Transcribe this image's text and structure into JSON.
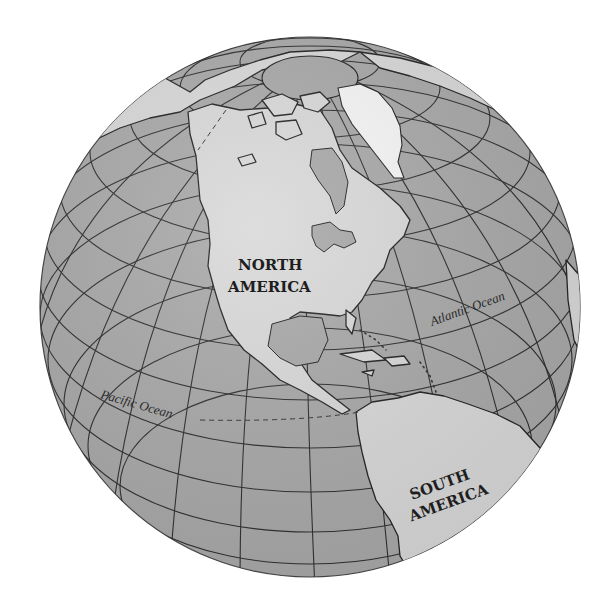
{
  "map": {
    "type": "orthographic-globe",
    "center_region": "Western Hemisphere",
    "colors": {
      "background": "#ffffff",
      "ocean": "#a9a9a9",
      "land": "#d9d9d9",
      "ice": "#f6f6f6",
      "lines": "#2e2e2e"
    },
    "labels": {
      "north_america": [
        "NORTH",
        "AMERICA"
      ],
      "south_america": [
        "SOUTH",
        "AMERICA"
      ],
      "atlantic": "Atlantic Ocean",
      "pacific": "Pacific Ocean"
    },
    "features": [
      "Greenland",
      "Arctic Ocean",
      "Hudson Bay",
      "Great Lakes",
      "Gulf of Mexico",
      "Caribbean Sea",
      "Central America",
      "Equator (dashed)"
    ]
  }
}
